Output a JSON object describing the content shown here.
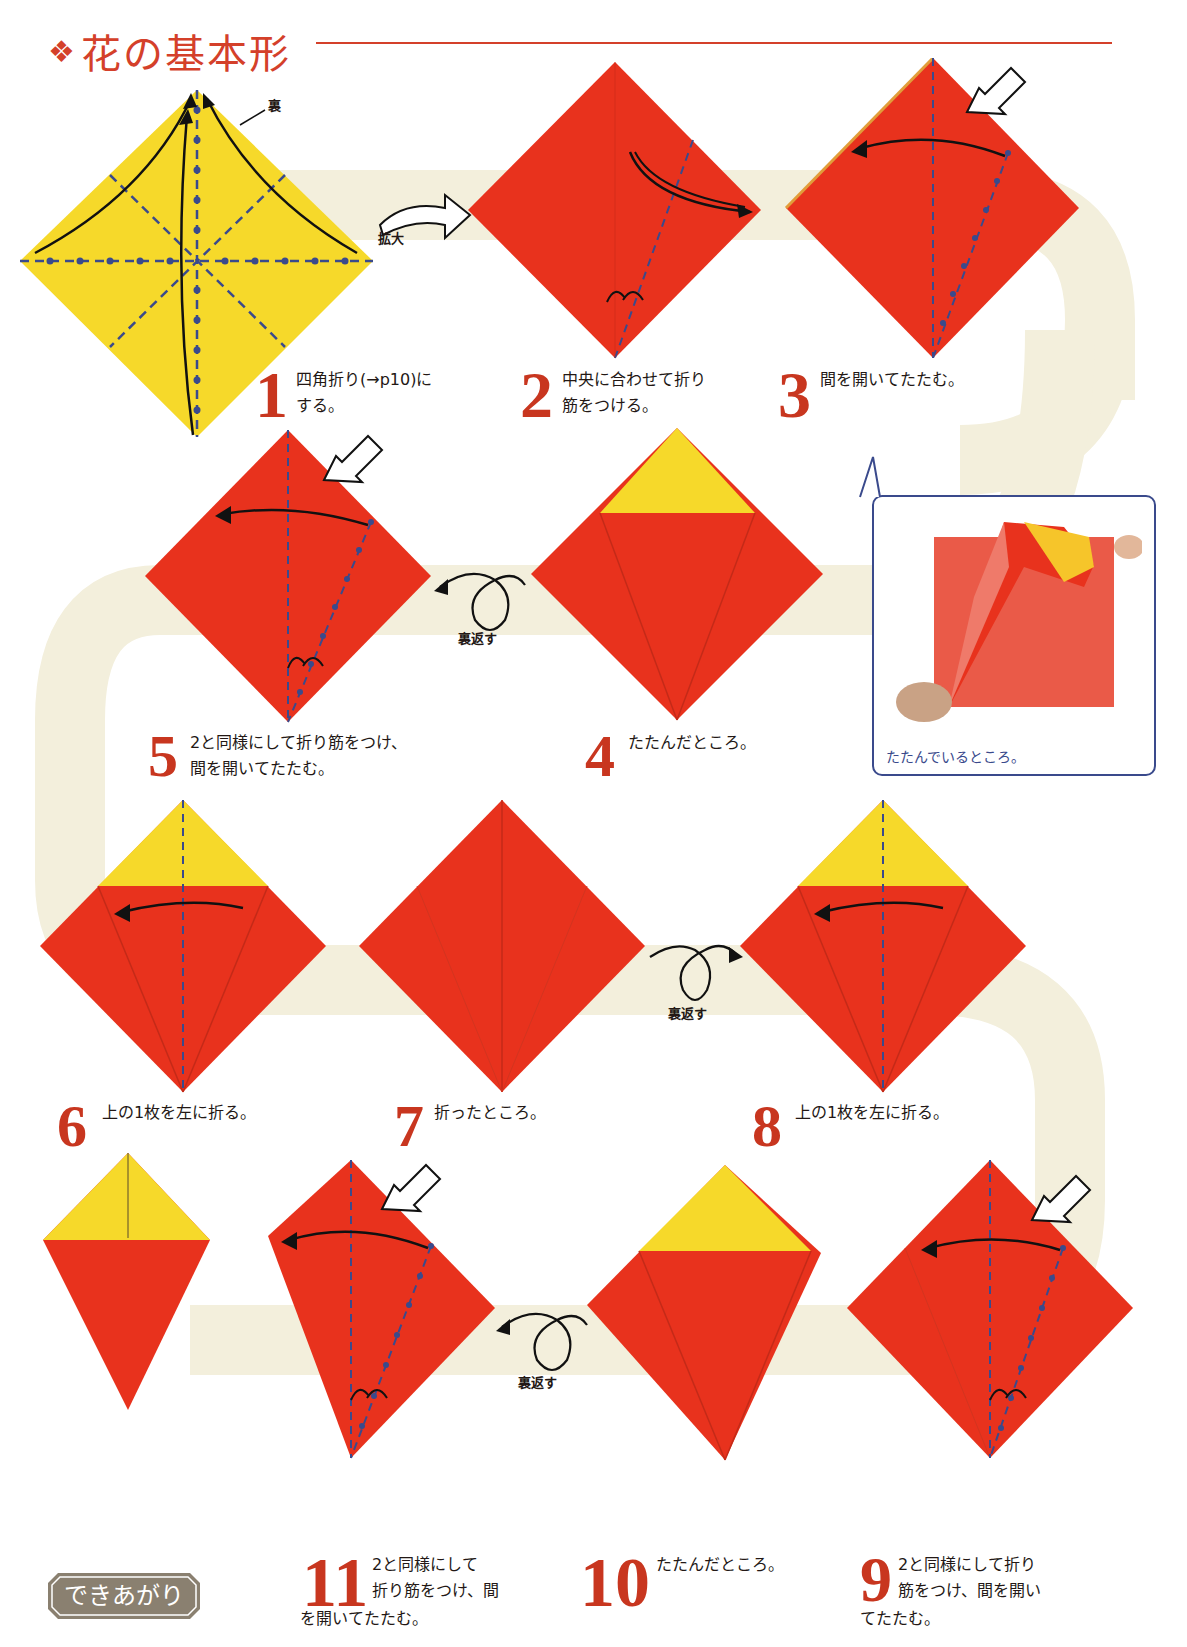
{
  "header": {
    "title": "花の基本形",
    "title_mark": "❖"
  },
  "colors": {
    "red": "#e8321d",
    "yellow": "#f6d92a",
    "accent": "#d4402a",
    "crease": "#3a4a8c",
    "path_bg": "#f3efdc",
    "badge": "#8a8070"
  },
  "labels": {
    "ura": "裏",
    "kakudai": "拡大",
    "uragaesu": "裏返す",
    "photo_caption": "たたんでいるところ。",
    "done": "できあがり"
  },
  "steps": [
    {
      "num": "1",
      "line1": "四角折り(→p10)に",
      "line2": "する。"
    },
    {
      "num": "2",
      "line1": "中央に合わせて折り",
      "line2": "筋をつける。"
    },
    {
      "num": "3",
      "line1": "間を開いてたたむ。",
      "line2": ""
    },
    {
      "num": "4",
      "line1": "たたんだところ。",
      "line2": ""
    },
    {
      "num": "5",
      "line1": "2と同様にして折り筋をつけ、",
      "line2": "間を開いてたたむ。"
    },
    {
      "num": "6",
      "line1": "上の1枚を左に折る。",
      "line2": ""
    },
    {
      "num": "7",
      "line1": "折ったところ。",
      "line2": ""
    },
    {
      "num": "8",
      "line1": "上の1枚を左に折る。",
      "line2": ""
    },
    {
      "num": "9",
      "line1": "2と同様にして折り",
      "line2": "筋をつけ、間を開い",
      "line3": "てたたむ。"
    },
    {
      "num": "10",
      "line1": "たたんだところ。",
      "line2": ""
    },
    {
      "num": "11",
      "line1": "2と同様にして",
      "line2": "折り筋をつけ、間",
      "line3": "を開いてたたむ。"
    }
  ]
}
